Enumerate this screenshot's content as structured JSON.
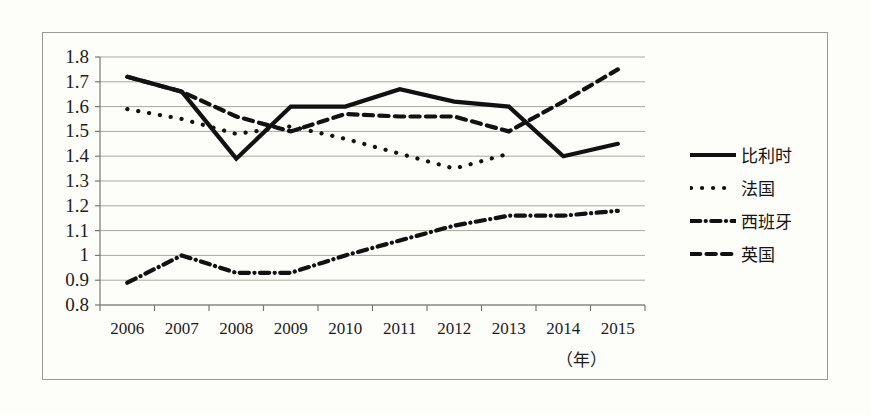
{
  "figure": {
    "background_color": "#fdfdfa",
    "frame_color": "#9a9a93",
    "line_color": "#111111",
    "grid_color": "#a8a8a2",
    "axis_unit_label": "（年）"
  },
  "chart_data": {
    "type": "line",
    "title": "",
    "subtitle": "",
    "xlabel": "（年）",
    "ylabel": "",
    "grid": true,
    "legend_position": "right",
    "x": [
      2006,
      2007,
      2008,
      2009,
      2010,
      2011,
      2012,
      2013,
      2014,
      2015
    ],
    "categories": [
      "2006",
      "2007",
      "2008",
      "2009",
      "2010",
      "2011",
      "2012",
      "2013",
      "2014",
      "2015"
    ],
    "xtick_labels": [
      "2006",
      "2007",
      "2008",
      "2009",
      "2010",
      "2011",
      "2012",
      "2013",
      "2014",
      "2015"
    ],
    "ytick_labels": [
      "1.8",
      "1.7",
      "1.6",
      "1.5",
      "1.4",
      "1.3",
      "1.2",
      "1.1",
      "1",
      "0.9",
      "0.8"
    ],
    "ylim": [
      0.8,
      1.8
    ],
    "ytick_step": 0.1,
    "series": [
      {
        "name": "比利时",
        "style": "solid",
        "color": "#111111",
        "values": [
          1.72,
          1.66,
          1.39,
          1.6,
          1.6,
          1.67,
          1.62,
          1.6,
          1.4,
          1.45
        ]
      },
      {
        "name": "法国",
        "style": "dotted",
        "color": "#111111",
        "values": [
          1.59,
          1.55,
          1.49,
          1.52,
          1.47,
          1.41,
          1.35,
          1.41,
          null,
          null
        ]
      },
      {
        "name": "西班牙",
        "style": "dashdot",
        "color": "#111111",
        "values": [
          0.89,
          1.0,
          0.93,
          0.93,
          1.0,
          1.06,
          1.12,
          1.16,
          1.16,
          1.18
        ]
      },
      {
        "name": "英国",
        "style": "dashed",
        "color": "#111111",
        "values": [
          1.72,
          1.66,
          1.56,
          1.5,
          1.57,
          1.56,
          1.56,
          1.5,
          1.62,
          1.75
        ]
      }
    ]
  },
  "legend": {
    "items": [
      {
        "label": "比利时",
        "style": "solid"
      },
      {
        "label": "法国",
        "style": "dotted"
      },
      {
        "label": "西班牙",
        "style": "dashdot"
      },
      {
        "label": "英国",
        "style": "dashed"
      }
    ]
  }
}
